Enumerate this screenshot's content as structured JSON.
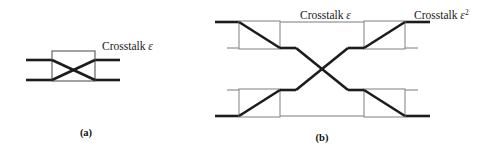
{
  "figure": {
    "panels": [
      {
        "id": "panel-a",
        "caption": "(a)",
        "caption_x": 86,
        "caption_y": 136,
        "labels": [
          {
            "name": "crosstalk-label-a",
            "text": "Crosstalk",
            "symbol": "ε",
            "superscript": "",
            "x": 102,
            "y": 50
          }
        ],
        "boxes": [
          {
            "name": "switch-box-a",
            "x": 52,
            "y": 51,
            "width": 43,
            "height": 30,
            "diagonals": "both"
          }
        ]
      },
      {
        "id": "panel-b",
        "caption": "(b)",
        "caption_x": 322,
        "caption_y": 141,
        "labels": [
          {
            "name": "crosstalk-label-b-first-order",
            "text": "Crosstalk",
            "symbol": "ε",
            "superscript": "",
            "x": 300,
            "y": 19
          },
          {
            "name": "crosstalk-label-b-second-order",
            "text": "Crosstalk",
            "symbol": "ε",
            "superscript": "2",
            "x": 414,
            "y": 19
          }
        ],
        "boxes": [
          {
            "name": "switch-box-b-top-left",
            "x": 239,
            "y": 21,
            "width": 41,
            "height": 28,
            "diagonals": "tl-br"
          },
          {
            "name": "switch-box-b-top-right",
            "x": 364,
            "y": 21,
            "width": 41,
            "height": 28,
            "diagonals": "bl-tr"
          },
          {
            "name": "switch-box-b-bottom-left",
            "x": 239,
            "y": 89,
            "width": 41,
            "height": 28,
            "diagonals": "bl-tr"
          },
          {
            "name": "switch-box-b-bottom-right",
            "x": 364,
            "y": 89,
            "width": 41,
            "height": 28,
            "diagonals": "tl-br"
          }
        ]
      }
    ],
    "colors": {
      "thick_stroke": "#1c1c1c",
      "thin_stroke": "#7a7a7a",
      "box_stroke": "#8a8a8a",
      "background": "#ffffff",
      "text": "#1a1a1a"
    }
  }
}
